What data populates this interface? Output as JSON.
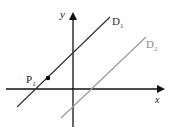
{
  "diagram": {
    "type": "coordinate-plane",
    "axes": {
      "x_label": "x",
      "y_label": "y",
      "color": "#111111"
    },
    "lines": [
      {
        "id": "D1",
        "label": "D",
        "subscript": "1",
        "color": "#333333"
      },
      {
        "id": "D2",
        "label": "D",
        "subscript": "2",
        "color": "#9a9a9a"
      }
    ],
    "points": [
      {
        "id": "P1",
        "label": "P",
        "subscript": "1",
        "on_line": "D1",
        "color": "#000000"
      }
    ]
  }
}
